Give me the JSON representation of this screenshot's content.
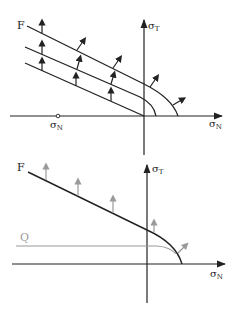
{
  "top_diagram": {
    "curve_label": "F",
    "y_axis_label": "σ",
    "y_axis_sub": "T",
    "x_axis_label": "σ",
    "x_axis_sub": "N",
    "origin_point_label": "σ",
    "origin_point_sub": "N"
  },
  "bottom_diagram": {
    "curve_label": "F",
    "second_curve_label": "Q",
    "y_axis_label": "σ",
    "y_axis_sub": "T",
    "x_axis_label": "σ",
    "x_axis_sub": "N"
  },
  "colors": {
    "ink": "#222222",
    "gray": "#9a9a9a"
  }
}
